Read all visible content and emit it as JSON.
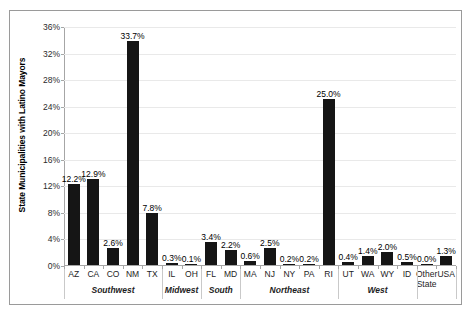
{
  "chart_data": {
    "type": "bar",
    "title": "",
    "xlabel": "",
    "ylabel": "State Municipalities with Latino Mayors",
    "ylim": [
      0,
      36
    ],
    "ytick_labels": [
      "0%",
      "4%",
      "8%",
      "12%",
      "16%",
      "20%",
      "24%",
      "28%",
      "32%",
      "36%"
    ],
    "ytick_values": [
      0,
      4,
      8,
      12,
      16,
      20,
      24,
      28,
      32,
      36
    ],
    "grid": true,
    "legend": "none",
    "bar_color": "#151515",
    "categories": [
      "AZ",
      "CA",
      "CO",
      "NM",
      "TX",
      "IL",
      "OH",
      "FL",
      "MD",
      "MA",
      "NJ",
      "NY",
      "PA",
      "RI",
      "UT",
      "WA",
      "WY",
      "ID",
      "Other State",
      "USA"
    ],
    "values": [
      12.2,
      12.9,
      2.6,
      33.7,
      7.8,
      0.3,
      0.1,
      3.4,
      2.2,
      0.6,
      2.5,
      0.2,
      0.2,
      25.0,
      0.4,
      1.4,
      2.0,
      0.5,
      0.0,
      1.3
    ],
    "data_labels": [
      "12.2%",
      "12.9%",
      "2.6%",
      "33.7%",
      "7.8%",
      "0.3%",
      "0.1%",
      "3.4%",
      "2.2%",
      "0.6%",
      "2.5%",
      "0.2%",
      "0.2%",
      "25.0%",
      "0.4%",
      "1.4%",
      "2.0%",
      "0.5%",
      "0.0%",
      "1.3%"
    ],
    "groups": [
      {
        "label": "Southwest",
        "start": 0,
        "end": 4
      },
      {
        "label": "Midwest",
        "start": 5,
        "end": 6
      },
      {
        "label": "South",
        "start": 7,
        "end": 8
      },
      {
        "label": "Northeast",
        "start": 9,
        "end": 13
      },
      {
        "label": "West",
        "start": 14,
        "end": 17
      },
      {
        "label": "",
        "start": 18,
        "end": 19
      }
    ]
  }
}
